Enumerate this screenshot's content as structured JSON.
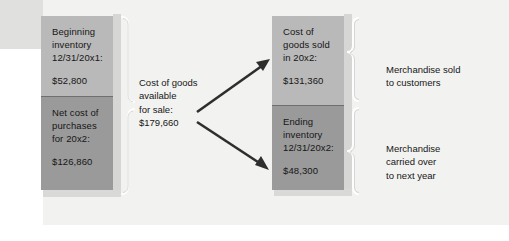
{
  "figure": {
    "type": "flow-diagram",
    "topic": "Cost of goods available for sale allocation",
    "background_color": "#f2f2f0",
    "box_light_color": "#b9b9b9",
    "box_dark_color": "#9a9a9a"
  },
  "left_boxes": [
    {
      "id": "beginning-inventory",
      "lines": [
        "Beginning",
        "inventory",
        "12/31/20x1:"
      ],
      "amount": "$52,800",
      "shade": "light"
    },
    {
      "id": "net-cost-of-purchases",
      "lines": [
        "Net cost of",
        "purchases",
        "for 20x2:"
      ],
      "amount": "$126,860",
      "shade": "dark"
    }
  ],
  "middle": {
    "id": "cost-of-goods-available-for-sale",
    "lines": [
      "Cost of goods",
      "available",
      "for sale:"
    ],
    "amount": "$179,660"
  },
  "right_boxes": [
    {
      "id": "cost-of-goods-sold",
      "lines": [
        "Cost of",
        "goods sold",
        "in 20x2:"
      ],
      "amount": "$131,360",
      "shade": "light"
    },
    {
      "id": "ending-inventory",
      "lines": [
        "Ending",
        "inventory",
        "12/31/20x2:"
      ],
      "amount": "$48,300",
      "shade": "dark"
    }
  ],
  "right_labels": [
    {
      "id": "merchandise-sold",
      "lines": [
        "Merchandise sold",
        "to customers"
      ]
    },
    {
      "id": "merchandise-carried-over",
      "lines": [
        "Merchandise",
        "carried over",
        "to next year"
      ]
    }
  ],
  "connectors": {
    "left_brace": "brace-groups-beginning-and-purchases",
    "arrow_up": "arrow-to-cost-of-goods-sold",
    "arrow_down": "arrow-to-ending-inventory",
    "right_brace_top": "brace-cost-of-goods-sold",
    "right_brace_bottom": "brace-ending-inventory"
  }
}
